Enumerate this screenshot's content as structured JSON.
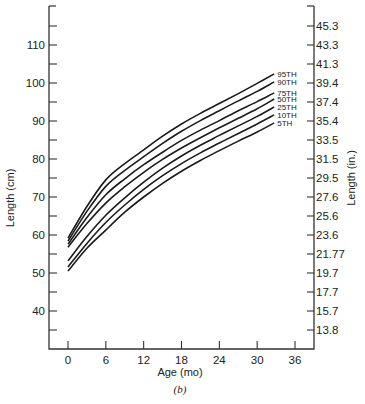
{
  "chart_data": {
    "type": "line",
    "title": "",
    "caption": "(b)",
    "xlabel": "Age (mo)",
    "ylabel": "Length (cm)",
    "ylabel_right": "Length (in.)",
    "xlim": [
      -3,
      39
    ],
    "ylim": [
      30,
      120
    ],
    "x_ticks": [
      0,
      6,
      12,
      18,
      24,
      30,
      36
    ],
    "y_ticks": [
      40,
      50,
      60,
      70,
      80,
      90,
      100,
      110
    ],
    "y_minor_ticks": [
      35,
      45,
      55,
      65,
      75,
      85,
      95,
      105,
      115
    ],
    "y_right_ticks_cm": [
      115,
      110,
      105,
      100,
      95,
      90,
      85,
      80,
      75,
      70,
      65,
      60,
      55,
      50,
      45,
      40,
      35
    ],
    "y_right_tick_labels": [
      "45.3",
      "43.3",
      "41.3",
      "39.4",
      "37.4",
      "35.4",
      "33.5",
      "31.5",
      "29.5",
      "27.6",
      "25.6",
      "23.6",
      "21.77",
      "19.7",
      "17.7",
      "15.7",
      "13.8"
    ],
    "grid": false,
    "legend_position": "inline-right",
    "x": [
      0,
      3,
      6,
      9,
      12,
      15,
      18,
      21,
      24,
      27,
      30,
      32.7
    ],
    "series": [
      {
        "name": "95TH",
        "values": [
          59.2,
          67.5,
          74.5,
          78.8,
          82.4,
          86.0,
          89.2,
          92.0,
          94.6,
          97.2,
          99.9,
          102.4
        ]
      },
      {
        "name": "90TH",
        "values": [
          58.4,
          66.2,
          72.8,
          77.0,
          80.6,
          84.1,
          87.3,
          90.1,
          92.7,
          95.3,
          97.8,
          100.3
        ]
      },
      {
        "name": "75TH",
        "values": [
          57.6,
          64.6,
          70.6,
          74.8,
          78.5,
          81.8,
          84.9,
          87.6,
          90.1,
          92.7,
          95.1,
          97.4
        ]
      },
      {
        "name": "50TH",
        "values": [
          56.8,
          63.0,
          68.4,
          72.7,
          76.5,
          79.9,
          82.9,
          85.6,
          88.2,
          90.7,
          93.2,
          95.8
        ]
      },
      {
        "name": "25TH",
        "values": [
          53.2,
          59.6,
          65.2,
          69.8,
          73.9,
          77.6,
          80.8,
          83.6,
          86.2,
          88.7,
          91.2,
          93.7
        ]
      },
      {
        "name": "10TH",
        "values": [
          51.6,
          57.8,
          63.3,
          67.9,
          72.0,
          75.6,
          78.8,
          81.6,
          84.2,
          86.7,
          89.2,
          91.6
        ]
      },
      {
        "name": "5TH",
        "values": [
          50.5,
          56.5,
          61.3,
          66.0,
          70.0,
          73.6,
          76.8,
          79.6,
          82.2,
          84.7,
          87.1,
          89.5
        ]
      }
    ],
    "colors": {
      "line": "#1a1a1a",
      "axis": "#333333",
      "background": "#ffffff"
    }
  }
}
